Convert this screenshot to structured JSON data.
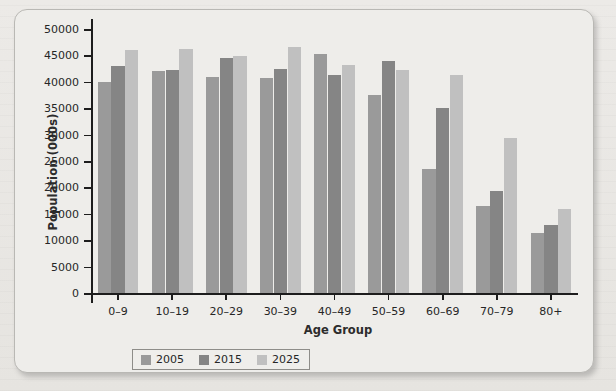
{
  "chart_data": {
    "type": "bar",
    "title": "",
    "xlabel": "Age Group",
    "ylabel": "Population (000s)",
    "ylim": [
      0,
      50000
    ],
    "ytick_step": 5000,
    "yticks": [
      0,
      5000,
      10000,
      15000,
      20000,
      25000,
      30000,
      35000,
      40000,
      45000,
      50000
    ],
    "ytick_labels": [
      "0",
      "5000",
      "10000",
      "15000",
      "20000",
      "25000",
      "30000",
      "35000",
      "40000",
      "45000",
      "50000"
    ],
    "grid": false,
    "legend_position": "bottom-center",
    "categories": [
      "0–9",
      "10–19",
      "20–29",
      "30–39",
      "40–49",
      "50–59",
      "60–69",
      "70–79",
      "80+"
    ],
    "series": [
      {
        "name": "2005",
        "color": "#9a9a9a",
        "values": [
          40000,
          42000,
          41000,
          40800,
          45300,
          37500,
          23400,
          16500,
          11400
        ]
      },
      {
        "name": "2015",
        "color": "#858585",
        "values": [
          43000,
          42300,
          44500,
          42500,
          41200,
          44000,
          35000,
          19400,
          12800
        ]
      },
      {
        "name": "2025",
        "color": "#c0c0c0",
        "values": [
          46000,
          46300,
          44800,
          46500,
          43200,
          42200,
          41300,
          29400,
          15900
        ]
      }
    ]
  },
  "legend": {
    "items": [
      {
        "label": "2005",
        "color": "#9a9a9a"
      },
      {
        "label": "2015",
        "color": "#858585"
      },
      {
        "label": "2025",
        "color": "#c0c0c0"
      }
    ]
  }
}
